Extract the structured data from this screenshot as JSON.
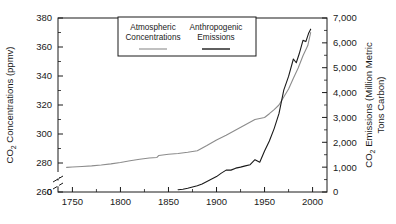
{
  "chart_data": {
    "type": "line",
    "title": "",
    "xlabel": "",
    "xlim": [
      1735,
      2015
    ],
    "xticks": [
      1750,
      1800,
      1850,
      1900,
      1950,
      2000
    ],
    "xtick_labels": [
      "1750",
      "1800",
      "1850",
      "1900",
      "1950",
      "2000"
    ],
    "grid": false,
    "legend_position": "top-center",
    "axes": [
      {
        "side": "left",
        "label_line1": "CO2 Concentrations (ppmv)",
        "label_prefix": "CO",
        "label_subscript": "2",
        "label_suffix": " Concentrations (ppmv)",
        "ylim": [
          260,
          380
        ],
        "yticks": [
          260,
          280,
          300,
          320,
          340,
          360,
          380
        ],
        "ytick_labels": [
          "260",
          "280",
          "300",
          "320",
          "340",
          "360",
          "380"
        ],
        "axis_break": true,
        "break_tick_label": "0",
        "minor_ticks": true
      },
      {
        "side": "right",
        "label_prefix": "CO",
        "label_subscript": "2",
        "label_suffix": " Emissions (Million Metric",
        "label_line2": "Tons Carbon)",
        "ylim": [
          0,
          7000
        ],
        "yticks": [
          0,
          1000,
          2000,
          3000,
          4000,
          5000,
          6000,
          7000
        ],
        "ytick_labels": [
          "0",
          "1,000",
          "2,000",
          "3,000",
          "4,000",
          "5,000",
          "6,000",
          "7,000"
        ],
        "minor_ticks": true
      }
    ],
    "series": [
      {
        "name": "Atmospheric Concentrations",
        "legend_label_line1": "Atmospheric",
        "legend_label_line2": "Concentrations",
        "color": "#8c8c8c",
        "axis": "left",
        "units": "ppmv",
        "x": [
          1744,
          1750,
          1760,
          1770,
          1780,
          1790,
          1800,
          1810,
          1820,
          1830,
          1838,
          1840,
          1850,
          1860,
          1870,
          1880,
          1890,
          1900,
          1910,
          1920,
          1930,
          1940,
          1950,
          1955,
          1960,
          1965,
          1970,
          1975,
          1980,
          1985,
          1990,
          1995,
          1998
        ],
        "y": [
          277.0,
          277.2,
          277.6,
          278.0,
          278.6,
          279.4,
          280.4,
          281.6,
          282.6,
          283.4,
          283.8,
          285.2,
          286.0,
          286.6,
          287.4,
          288.4,
          292.0,
          295.8,
          299.2,
          302.8,
          306.4,
          310.0,
          311.4,
          314.0,
          316.8,
          320.0,
          325.5,
          331.0,
          338.5,
          345.5,
          354.0,
          361.0,
          370.0
        ]
      },
      {
        "name": "Anthropogenic Emissions",
        "legend_label_line1": "Anthropogenic",
        "legend_label_line2": "Emissions",
        "color": "#1a1a1a",
        "axis": "right",
        "units": "Million Metric Tons Carbon",
        "x": [
          1860,
          1865,
          1870,
          1875,
          1880,
          1885,
          1890,
          1895,
          1900,
          1905,
          1910,
          1915,
          1920,
          1925,
          1930,
          1935,
          1940,
          1945,
          1950,
          1955,
          1960,
          1965,
          1970,
          1975,
          1980,
          1983,
          1986,
          1990,
          1993,
          1996,
          1998
        ],
        "y": [
          90,
          110,
          150,
          200,
          250,
          320,
          420,
          520,
          620,
          760,
          880,
          880,
          960,
          1000,
          1050,
          1100,
          1300,
          1200,
          1650,
          2050,
          2550,
          3150,
          4100,
          4650,
          5350,
          5200,
          5550,
          6100,
          6050,
          6400,
          6550
        ]
      }
    ]
  }
}
